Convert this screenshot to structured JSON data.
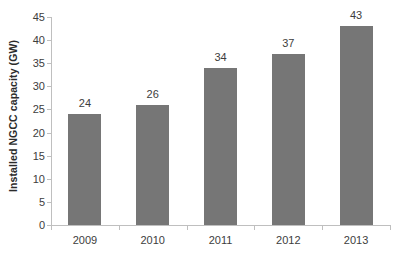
{
  "chart_data": {
    "type": "bar",
    "title": "",
    "xlabel": "",
    "ylabel": "Installed NGCC capacity  (GW)",
    "categories": [
      "2009",
      "2010",
      "2011",
      "2012",
      "2013"
    ],
    "values": [
      24,
      26,
      34,
      37,
      43
    ],
    "data_labels": [
      "24",
      "26",
      "34",
      "37",
      "43"
    ],
    "ylim": [
      0,
      45
    ],
    "ytick_step": 5,
    "ytick_labels": [
      "0",
      "5",
      "10",
      "15",
      "20",
      "25",
      "30",
      "35",
      "40",
      "45"
    ],
    "ytick_values": [
      0,
      5,
      10,
      15,
      20,
      25,
      30,
      35,
      40,
      45
    ],
    "grid": false,
    "legend": false,
    "bar_color": "#767676",
    "axis_color": "#bfbfbf",
    "text_color": "#3d3d3d",
    "background_color": "#ffffff"
  }
}
